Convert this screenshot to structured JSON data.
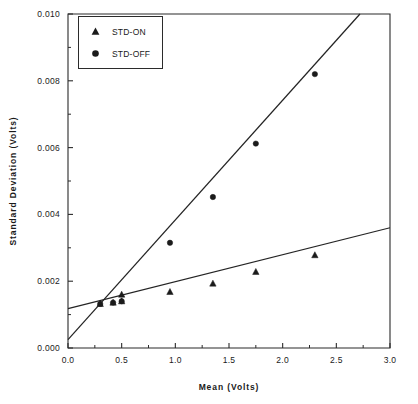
{
  "chart_data": {
    "type": "scatter",
    "title": "",
    "xlabel": "Mean   (Volts)",
    "ylabel": "Standard   Deviation   (Volts)",
    "xlim": [
      0.0,
      3.0
    ],
    "ylim": [
      0.0,
      0.01
    ],
    "grid": false,
    "legend_position": "top-left",
    "x_ticks": [
      "0.0",
      "0.5",
      "1.0",
      "1.5",
      "2.0",
      "2.5",
      "3.0"
    ],
    "x_tick_values": [
      0.0,
      0.5,
      1.0,
      1.5,
      2.0,
      2.5,
      3.0
    ],
    "x_minor_values": [
      0.25,
      0.75,
      1.25,
      1.75,
      2.25,
      2.75
    ],
    "y_ticks": [
      "0.000",
      "0.002",
      "0.004",
      "0.006",
      "0.008",
      "0.010"
    ],
    "y_tick_values": [
      0.0,
      0.002,
      0.004,
      0.006,
      0.008,
      0.01
    ],
    "y_minor_values": [
      0.001,
      0.003,
      0.005,
      0.007,
      0.009
    ],
    "series": [
      {
        "name": "STD-ON",
        "marker": "triangle",
        "color": "#1b1b1b",
        "x": [
          0.3,
          0.42,
          0.5,
          0.5,
          0.95,
          1.35,
          1.75,
          2.3
        ],
        "y": [
          0.00132,
          0.00136,
          0.0016,
          0.0014,
          0.00168,
          0.00193,
          0.00228,
          0.00278
        ],
        "fit_x": [
          0.0,
          3.0
        ],
        "fit_y": [
          0.00118,
          0.0036
        ]
      },
      {
        "name": "STD-OFF",
        "marker": "circle",
        "color": "#1b1b1b",
        "x": [
          0.3,
          0.42,
          0.5,
          0.95,
          1.35,
          1.75,
          2.3
        ],
        "y": [
          0.00132,
          0.00136,
          0.0014,
          0.00315,
          0.00452,
          0.00612,
          0.0082
        ],
        "fit_x": [
          0.0,
          2.72
        ],
        "fit_y": [
          0.00025,
          0.01
        ]
      }
    ]
  },
  "legend": {
    "items": [
      {
        "label": "STD-ON",
        "marker": "triangle"
      },
      {
        "label": "STD-OFF",
        "marker": "circle"
      }
    ]
  }
}
